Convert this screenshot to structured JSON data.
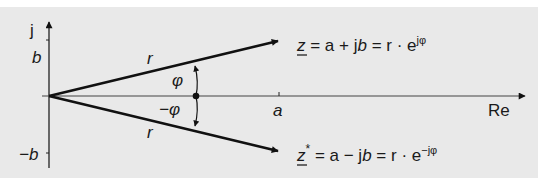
{
  "diagram": {
    "type": "complex-plane-phasor",
    "background": "#e9e9e9",
    "axes": {
      "imaginary_label": "j",
      "real_label": "Re",
      "ticks": {
        "imag_positive": "b",
        "imag_negative": "−b",
        "real": "a"
      }
    },
    "vectors": [
      {
        "id": "z",
        "magnitude_label": "r",
        "angle_label": "φ",
        "equation": {
          "lhs": "z",
          "rhs1": " = a + j",
          "b": "b",
          "rhs2": " = r · e",
          "exp": "jφ"
        }
      },
      {
        "id": "z_conj",
        "magnitude_label": "r",
        "angle_label": "−φ",
        "equation": {
          "lhs": "z",
          "star": "*",
          "rhs1": " = a − j",
          "b": "b",
          "rhs2": " = r · e",
          "exp": "−jφ"
        }
      }
    ]
  }
}
